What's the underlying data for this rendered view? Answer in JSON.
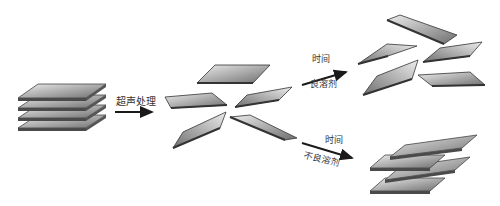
{
  "diagram": {
    "stages": [
      {
        "id": "stacked-layers",
        "description": "Stacked layered sheets (4 layers)"
      },
      {
        "id": "exfoliated-sheets",
        "description": "Dispersed exfoliated sheets after sonication (5 sheets)"
      },
      {
        "id": "stable-dispersion",
        "description": "Sheets remain dispersed (5 sheets)"
      },
      {
        "id": "restacked-layers",
        "description": "Sheets re-stacked (3 layers)"
      }
    ],
    "arrows": [
      {
        "id": "sonication",
        "from": "stacked-layers",
        "to": "exfoliated-sheets",
        "label_top": "超声处理",
        "label_bottom": ""
      },
      {
        "id": "good-solvent",
        "from": "exfoliated-sheets",
        "to": "stable-dispersion",
        "label_top": "时间",
        "label_bottom": "良溶剂"
      },
      {
        "id": "poor-solvent",
        "from": "exfoliated-sheets",
        "to": "restacked-layers",
        "label_top": "时间",
        "label_bottom": "不良溶剂"
      }
    ],
    "colors": {
      "sheet_light": "#e8e8e8",
      "sheet_dark": "#7a7a7a",
      "sheet_edge": "#3a3a3a",
      "arrow": "#1a1a1a"
    }
  }
}
